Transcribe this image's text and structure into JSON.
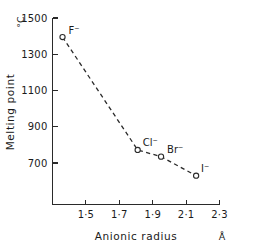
{
  "chart_data": {
    "type": "line",
    "title": "",
    "subtitle": "",
    "xlabel": "Anionic radius",
    "xunit": "Å",
    "ylabel": "Melting point",
    "yunit": "°C",
    "xlim": [
      1.3,
      2.3
    ],
    "ylim": [
      570,
      1500
    ],
    "grid": false,
    "legend": "none",
    "line_style": "dashed",
    "marker": "open-circle",
    "xticks": [
      1.5,
      1.7,
      1.9,
      2.1,
      2.3
    ],
    "xtick_labels": [
      "1·5",
      "1·7",
      "1·9",
      "2·1",
      "2·3"
    ],
    "xminor_ticks": [
      1.4,
      1.6,
      1.8,
      2.0,
      2.2
    ],
    "yticks": [
      1500,
      1300,
      1100,
      900,
      700
    ],
    "ytick_labels": [
      "1500",
      "1300",
      "1100",
      "900",
      "700"
    ],
    "points": [
      {
        "label": "F⁻",
        "x": 1.36,
        "y": 1395
      },
      {
        "label": "Cl⁻",
        "x": 1.81,
        "y": 772
      },
      {
        "label": "Br⁻",
        "x": 1.95,
        "y": 735
      },
      {
        "label": "I⁻",
        "x": 2.16,
        "y": 630
      }
    ],
    "point_labels": [
      "F⁻",
      "Cl⁻",
      "Br⁻",
      "I⁻"
    ],
    "x": [
      1.36,
      1.81,
      1.95,
      2.16
    ],
    "values": [
      1395,
      772,
      735,
      630
    ],
    "colors": {
      "axis": "#2a2a2a",
      "line": "#2a2a2a",
      "marker_fill": "#ffffff",
      "text": "#1a1a1a",
      "background": "#ffffff"
    }
  }
}
